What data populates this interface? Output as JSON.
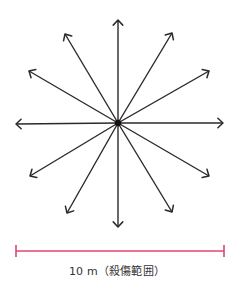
{
  "diagram": {
    "center": [
      118,
      123
    ],
    "arrow_color": "#2a2a2a",
    "center_color": "#1a0f10",
    "arrows": [
      {
        "direction": "up",
        "tip": [
          118,
          20
        ]
      },
      {
        "direction": "up-right-steep",
        "tip": [
          172,
          33
        ]
      },
      {
        "direction": "up-right-shallow",
        "tip": [
          209,
          71
        ]
      },
      {
        "direction": "right",
        "tip": [
          223,
          123
        ]
      },
      {
        "direction": "down-right-shallow",
        "tip": [
          209,
          176
        ]
      },
      {
        "direction": "down-right-steep",
        "tip": [
          172,
          212
        ]
      },
      {
        "direction": "down",
        "tip": [
          118,
          227
        ]
      },
      {
        "direction": "down-left-steep",
        "tip": [
          67,
          213
        ]
      },
      {
        "direction": "down-left-shallow",
        "tip": [
          30,
          176
        ]
      },
      {
        "direction": "left",
        "tip": [
          16,
          124
        ]
      },
      {
        "direction": "up-left-shallow",
        "tip": [
          29,
          71
        ]
      },
      {
        "direction": "up-left-steep",
        "tip": [
          65,
          34
        ]
      }
    ],
    "scale_bar": {
      "x1": 16,
      "x2": 224,
      "y": 251,
      "cap_half_height": 6,
      "color": "#e0446e"
    },
    "caption": "10 m（殺傷範囲）"
  }
}
